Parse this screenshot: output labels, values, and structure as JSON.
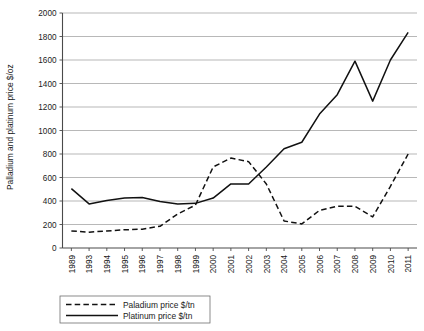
{
  "chart_data": {
    "type": "line",
    "title": "",
    "xlabel": "",
    "ylabel": "Palladium and platinum price $/oz",
    "ylim": [
      0,
      2000
    ],
    "ytick_step": 200,
    "grid": true,
    "legend_position": "bottom",
    "categories": [
      "1989",
      "1993",
      "1994",
      "1995",
      "1996",
      "1997",
      "1998",
      "1999",
      "2000",
      "2001",
      "2002",
      "2003",
      "2004",
      "2005",
      "2006",
      "2007",
      "2008",
      "2009",
      "2010",
      "2011"
    ],
    "ytick_labels": [
      "0",
      "200",
      "400",
      "600",
      "800",
      "1000",
      "1200",
      "1400",
      "1600",
      "1800",
      "2000"
    ],
    "series": [
      {
        "name": "Paladium price $/tn",
        "style": "dashed",
        "color": "#111111",
        "values": [
          145,
          135,
          145,
          155,
          160,
          185,
          290,
          365,
          690,
          765,
          735,
          545,
          230,
          205,
          320,
          355,
          355,
          265,
          525,
          800
        ]
      },
      {
        "name": "Platinum price $/tn",
        "style": "solid",
        "color": "#111111",
        "values": [
          505,
          375,
          405,
          425,
          430,
          395,
          375,
          380,
          425,
          545,
          545,
          690,
          845,
          900,
          1140,
          1305,
          1590,
          1250,
          1600,
          1835
        ]
      }
    ]
  },
  "legend": {
    "items": [
      {
        "label": "Paladium price $/tn",
        "style": "dashed"
      },
      {
        "label": "Platinum price $/tn",
        "style": "solid"
      }
    ]
  },
  "axes": {
    "y_title": "Palladium and platinum price $/oz"
  }
}
